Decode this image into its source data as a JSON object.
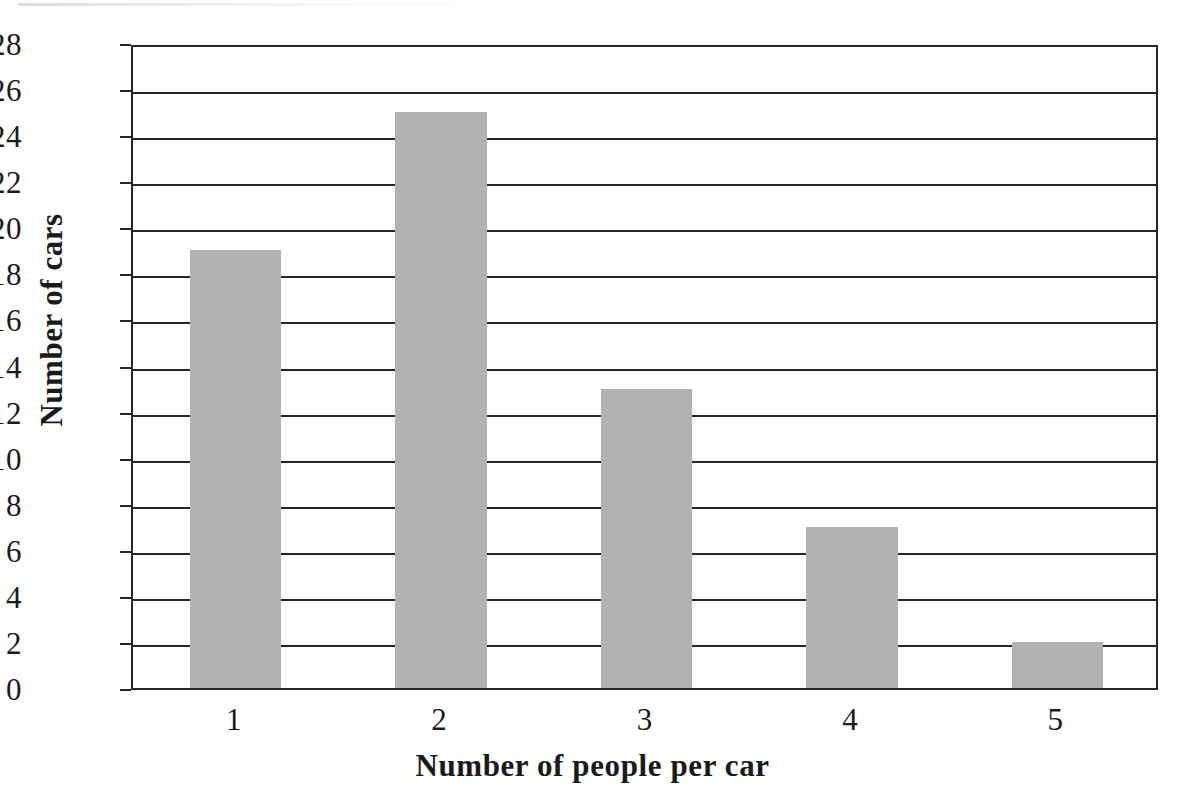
{
  "chart_data": {
    "type": "bar",
    "title": "",
    "xlabel": "Number of people per car",
    "ylabel": "Number of cars",
    "categories": [
      "1",
      "2",
      "3",
      "4",
      "5"
    ],
    "values": [
      19,
      25,
      13,
      7,
      2
    ],
    "series": [
      {
        "name": "Number of cars",
        "values": [
          19,
          25,
          13,
          7,
          2
        ]
      }
    ],
    "ylim": [
      0,
      28
    ],
    "xlim": [
      0,
      5
    ],
    "y_ticks": [
      0,
      2,
      4,
      6,
      8,
      10,
      12,
      14,
      16,
      18,
      20,
      22,
      24,
      26,
      28
    ],
    "y_tick_labels": [
      "0",
      "2",
      "4",
      "6",
      "8",
      "10",
      "12",
      "14",
      "16",
      "18",
      "20",
      "22",
      "24",
      "26",
      "28"
    ],
    "x_tick_labels": [
      "1",
      "2",
      "3",
      "4",
      "5"
    ],
    "grid": "horizontal",
    "legend": "none",
    "bar_color": "#b2b2b2",
    "axis_color": "#26262a",
    "background_color": "#ffffff"
  }
}
